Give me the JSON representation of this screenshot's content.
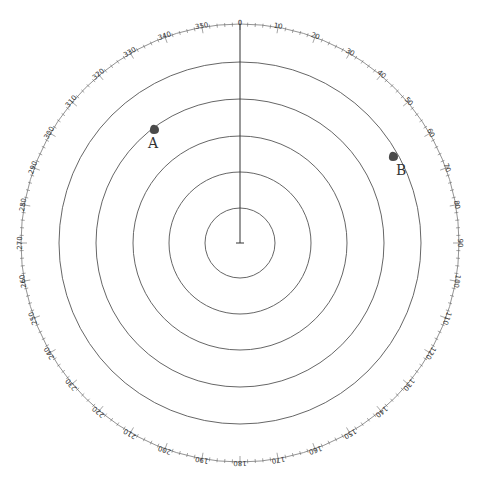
{
  "scope": {
    "center": [
      240,
      243
    ],
    "range_rings_radii": [
      35,
      71,
      107,
      144,
      181
    ],
    "bearing_scale_radius": 219,
    "heading_marker": "0",
    "colors": {
      "rings": "#555555",
      "targets": "#4a4a4a",
      "text": "#333333"
    }
  },
  "bearing_labels": [
    "0",
    "10",
    "20",
    "30",
    "40",
    "50",
    "60",
    "70",
    "80",
    "90",
    "100",
    "110",
    "120",
    "130",
    "140",
    "150",
    "160",
    "170",
    "180",
    "190",
    "200",
    "210",
    "220",
    "230",
    "240",
    "250",
    "260",
    "270",
    "280",
    "290",
    "300",
    "310",
    "320",
    "330",
    "340",
    "350"
  ],
  "targets": [
    {
      "label": "A",
      "marker_x": 154,
      "marker_y": 130,
      "label_x": 148,
      "label_y": 148
    },
    {
      "label": "B",
      "marker_x": 393,
      "marker_y": 157,
      "label_x": 396,
      "label_y": 175
    }
  ]
}
